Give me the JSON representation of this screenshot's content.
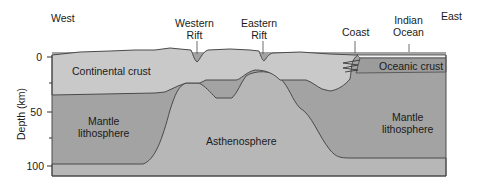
{
  "diagram": {
    "direction_labels": {
      "west": "West",
      "east": "East"
    },
    "surface_labels": {
      "western_rift": [
        "Western",
        "Rift"
      ],
      "eastern_rift": [
        "Eastern",
        "Rift"
      ],
      "coast": "Coast",
      "indian_ocean": [
        "Indian",
        "Ocean"
      ]
    },
    "region_labels": {
      "continental_crust": "Continental crust",
      "oceanic_crust": "Oceanic crust",
      "mantle_lithosphere_west": [
        "Mantle",
        "lithosphere"
      ],
      "mantle_lithosphere_east": [
        "Mantle",
        "lithosphere"
      ],
      "asthenosphere": "Asthenosphere"
    },
    "axis": {
      "label": "Depth (km)",
      "ticks": [
        "0",
        "50",
        "100"
      ]
    },
    "colors": {
      "continental_crust": "#c9c9c9",
      "mantle_lithosphere": "#a3a3a3",
      "asthenosphere": "#b7b7b7",
      "oceanic_crust": "#9c9c9c",
      "ocean_water": "#f4f4f4",
      "outline": "#4a4a4a"
    }
  }
}
